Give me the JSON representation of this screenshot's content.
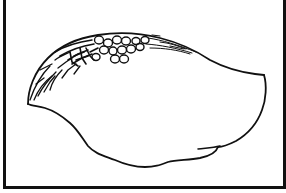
{
  "figure": {
    "stroke_color": "#111111",
    "background_color": "#ffffff",
    "frame_color": "#111111",
    "cells_count": 14
  }
}
